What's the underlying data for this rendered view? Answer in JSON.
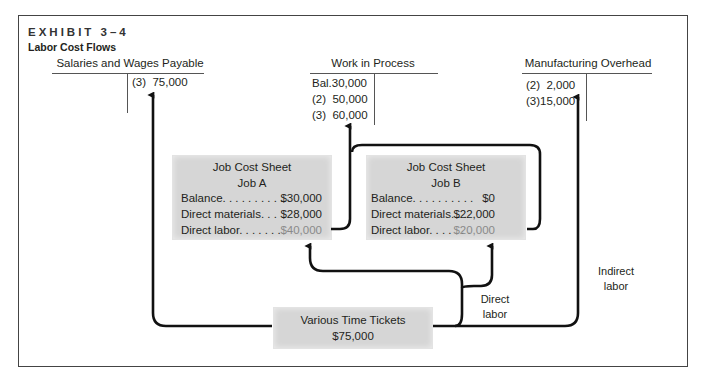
{
  "exhibit": {
    "label": "EXHIBIT 3–4",
    "title": "Labor Cost Flows"
  },
  "accounts": {
    "salaries": {
      "title": "Salaries and Wages Payable",
      "credits": [
        {
          "ref": "(3)",
          "amount": "75,000"
        }
      ]
    },
    "wip": {
      "title": "Work in Process",
      "debits": [
        {
          "ref": "Bal.",
          "amount": "30,000"
        },
        {
          "ref": "(2)",
          "amount": "50,000"
        },
        {
          "ref": "(3)",
          "amount": "60,000"
        }
      ]
    },
    "overhead": {
      "title": "Manufacturing Overhead",
      "debits": [
        {
          "ref": "(2)",
          "amount": "2,000"
        },
        {
          "ref": "(3)",
          "amount": "15,000"
        }
      ]
    }
  },
  "job_sheets": [
    {
      "title": "Job Cost Sheet",
      "job": "Job A",
      "rows": [
        {
          "label": "Balance. . . . . . . . . .",
          "value": "$30,000"
        },
        {
          "label": "Direct materials. . .",
          "value": "$28,000"
        },
        {
          "label": "Direct labor. . . . . . .",
          "value": "$40,000"
        }
      ]
    },
    {
      "title": "Job Cost Sheet",
      "job": "Job B",
      "rows": [
        {
          "label": "Balance. . . . . . . . . .",
          "value": "$0"
        },
        {
          "label": "Direct materials. . .",
          "value": "$22,000"
        },
        {
          "label": "Direct labor. . . . . . .",
          "value": "$20,000"
        }
      ]
    }
  ],
  "time_tickets": {
    "title": "Various Time Tickets",
    "amount": "$75,000"
  },
  "flow_labels": {
    "direct_line1": "Direct",
    "direct_line2": "labor",
    "indirect_line1": "Indirect",
    "indirect_line2": "labor"
  },
  "colors": {
    "sheet_fill": "#d6d6d6",
    "arrow": "#111111",
    "highlight_value": "#8a8a8a"
  }
}
